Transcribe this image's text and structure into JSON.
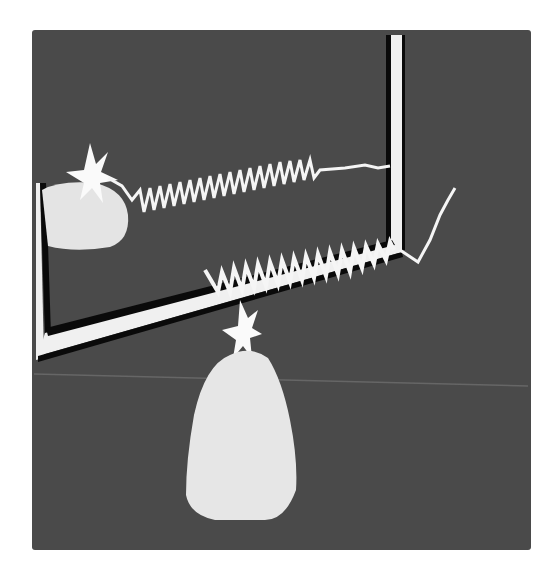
{
  "scene": {
    "description": "Grayscale rendering of a mirror with two dome-shaped objects topped by stars, connected by coiled springs",
    "colors": {
      "background": "#ffffff",
      "panel": "#4a4a4a",
      "floor_line": "#6a6a6a",
      "frame": "#f2f2f2",
      "frame_shadow": "#0a0a0a",
      "object": "#e6e6e6",
      "spring": "#f5f5f5"
    }
  }
}
